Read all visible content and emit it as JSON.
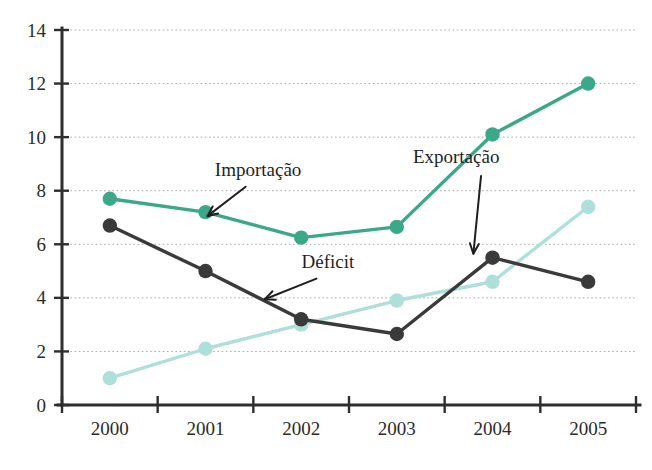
{
  "chart_data": {
    "type": "line",
    "title": "",
    "subtitle": "",
    "xlabel": "",
    "ylabel": "",
    "categories": [
      "2000",
      "2001",
      "2002",
      "2003",
      "2004",
      "2005"
    ],
    "x": [
      2000,
      2001,
      2002,
      2003,
      2004,
      2005
    ],
    "ylim": [
      0,
      14
    ],
    "yticks": [
      0,
      2,
      4,
      6,
      8,
      10,
      12,
      14
    ],
    "ytick_labels": [
      "0",
      "2",
      "4",
      "6",
      "8",
      "10",
      "12",
      "14"
    ],
    "grid": "horizontal-dotted",
    "legend": "none-inline-annotations",
    "series": [
      {
        "name": "Importação",
        "color": "#3CA88A",
        "marker": "circle",
        "values": [
          7.7,
          7.2,
          6.25,
          6.65,
          10.1,
          12.0
        ]
      },
      {
        "name": "Déficit",
        "color": "#3A3A3A",
        "marker": "circle",
        "values": [
          6.7,
          5.0,
          3.2,
          2.65,
          5.5,
          4.6
        ]
      },
      {
        "name": "Exportação",
        "color": "#AEDFDA",
        "marker": "circle",
        "values": [
          1.0,
          2.1,
          3.0,
          3.9,
          4.6,
          7.4
        ]
      }
    ],
    "annotations": [
      {
        "text": "Importação",
        "series": "Importação",
        "label_x": 2001.55,
        "label_y": 8.55,
        "arrow_from_x": 2001.42,
        "arrow_from_y": 8.15,
        "arrow_to_x": 2001.02,
        "arrow_to_y": 7.05
      },
      {
        "text": "Déficit",
        "series": "Déficit",
        "label_x": 2002.28,
        "label_y": 5.12,
        "arrow_from_x": 2002.16,
        "arrow_from_y": 4.72,
        "arrow_to_x": 2001.62,
        "arrow_to_y": 3.95
      },
      {
        "text": "Exportação",
        "series": "Exportação",
        "label_x": 2003.62,
        "label_y": 9.05,
        "arrow_from_x": 2003.88,
        "arrow_from_y": 8.55,
        "arrow_to_x": 2003.8,
        "arrow_to_y": 5.65
      }
    ],
    "colors": {
      "importacao": "#3CA88A",
      "deficit": "#3A3A3A",
      "exportacao": "#AEDFDA",
      "axis": "#2e2e2e",
      "grid": "#9a9a9a",
      "background": "#ffffff",
      "text": "#1f1f1f"
    }
  }
}
